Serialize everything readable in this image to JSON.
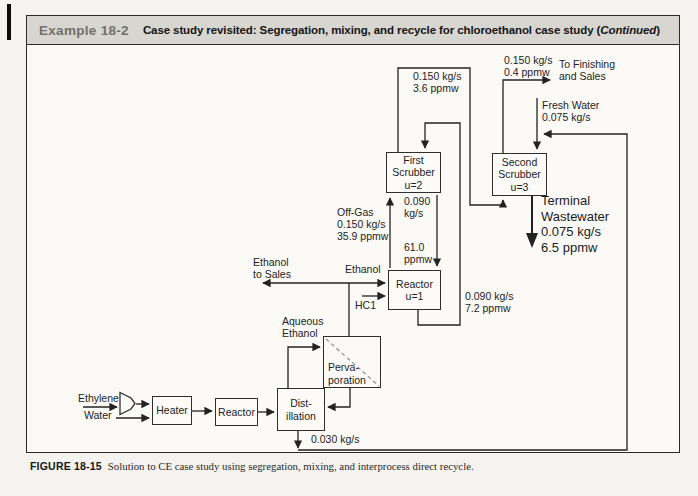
{
  "header": {
    "example_label": "Example 18-2",
    "title_main": "Case study revisited: Segregation, mixing, and recycle for chloroethanol case study (",
    "title_emphasis": "Continued",
    "title_close": ")"
  },
  "caption": {
    "figure_label": "FIGURE 18-15",
    "figure_text": "Solution to CE case study using segregation, mixing, and interprocess direct recycle."
  },
  "diagram": {
    "units": {
      "first_scrubber": "First\nScrubber\nu=2",
      "second_scrubber": "Second\nScrubber\nu=3",
      "reactor_u1": "Reactor\nu=1",
      "pervaporation": "Perva-\nporation",
      "distillation": "Dist-\nillation",
      "heater": "Heater",
      "reactor": "Reactor"
    },
    "streams": {
      "scrubber1_gas_out": "0.150 kg/s\n3.6 ppmw",
      "scrubber2_gas_out": "0.150 kg/s\n0.4 ppmw",
      "to_finishing": "To Finishing\nand Sales",
      "fresh_water": "Fresh Water\n0.075 kg/s",
      "terminal_wastewater": "Terminal\nWastewater\n0.075 kg/s\n6.5 ppmw",
      "off_gas": "Off-Gas\n0.150 kg/s\n35.9 ppmw",
      "scrubber1_liquid_flow": "0.090\nkg/s",
      "scrubber1_liquid_conc": "61.0\nppmw",
      "reactor_effluent": "0.090 kg/s\n7.2 ppmw",
      "ethanol_to_sales": "Ethanol\nto Sales",
      "ethanol": "Ethanol",
      "hcl": "HC1",
      "aqueous_ethanol": "Aqueous\nEthanol",
      "ethylene": "Ethylene",
      "water": "Water",
      "distillation_bottoms": "0.030 kg/s"
    }
  }
}
